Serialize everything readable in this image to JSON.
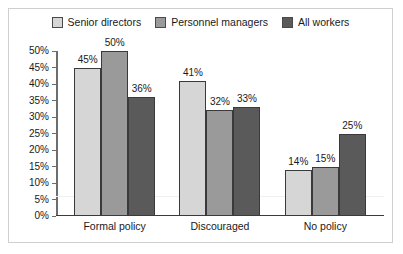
{
  "chart_data": {
    "type": "bar",
    "title": "",
    "xlabel": "",
    "ylabel": "",
    "categories": [
      "Formal policy",
      "Discouraged",
      "No policy"
    ],
    "series": [
      {
        "name": "Senior directors",
        "color": "#d6d6d6",
        "values": [
          45,
          50,
          14
        ],
        "labels": [
          "45%",
          "50%",
          "14%"
        ]
      },
      {
        "name": "Personnel managers",
        "color": "#9a9a9a",
        "values": [
          41,
          32,
          15
        ],
        "labels": [
          "41%",
          "32%",
          "15%"
        ]
      },
      {
        "name": "All workers",
        "color": "#5a5a5a",
        "values": [
          36,
          33,
          25
        ],
        "labels": [
          "36%",
          "33%",
          "25%"
        ]
      }
    ],
    "groups": [
      {
        "category": "Formal policy",
        "bars": [
          {
            "series": "Senior directors",
            "value": 45,
            "label": "45%",
            "color": "#d6d6d6"
          },
          {
            "series": "Personnel managers",
            "value": 50,
            "label": "50%",
            "color": "#9a9a9a"
          },
          {
            "series": "All workers",
            "value": 36,
            "label": "36%",
            "color": "#5a5a5a"
          }
        ]
      },
      {
        "category": "Discouraged",
        "bars": [
          {
            "series": "Senior directors",
            "value": 41,
            "label": "41%",
            "color": "#d6d6d6"
          },
          {
            "series": "Personnel managers",
            "value": 32,
            "label": "32%",
            "color": "#9a9a9a"
          },
          {
            "series": "All workers",
            "value": 33,
            "label": "33%",
            "color": "#5a5a5a"
          }
        ]
      },
      {
        "category": "No policy",
        "bars": [
          {
            "series": "Senior directors",
            "value": 14,
            "label": "14%",
            "color": "#d6d6d6"
          },
          {
            "series": "Personnel managers",
            "value": 15,
            "label": "15%",
            "color": "#9a9a9a"
          },
          {
            "series": "All workers",
            "value": 25,
            "label": "25%",
            "color": "#5a5a5a"
          }
        ]
      }
    ],
    "ylim": [
      0,
      50
    ],
    "ytick_step": 5,
    "ytick_labels": [
      "50%",
      "45%",
      "40%",
      "35%",
      "30%",
      "25%",
      "20%",
      "15%",
      "10%",
      "5%",
      "0%"
    ],
    "ytick_values": [
      50,
      45,
      40,
      35,
      30,
      25,
      20,
      15,
      10,
      5,
      0
    ],
    "grid": "single-light-line",
    "gridline_value": 6,
    "legend_position": "top-center"
  },
  "legend": {
    "items": [
      {
        "label": "Senior directors",
        "color": "#d6d6d6"
      },
      {
        "label": "Personnel managers",
        "color": "#9a9a9a"
      },
      {
        "label": "All workers",
        "color": "#5a5a5a"
      }
    ]
  },
  "colors": {
    "frame_border": "#cfcfcf",
    "axis": "#6d6d6d",
    "baseline": "#3a3a3a",
    "bar_outline": "#3a3a3a",
    "text": "#1a1a1a",
    "gridline": "#f0f0f0"
  }
}
